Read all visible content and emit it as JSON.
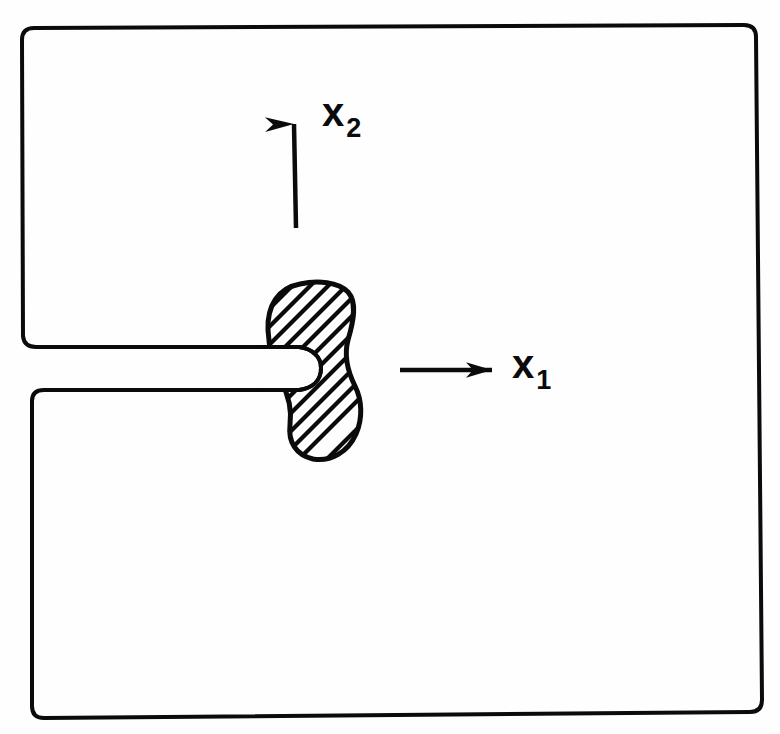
{
  "figure": {
    "background_color": "#fefefe",
    "ink_color": "#0b0b0b"
  },
  "labels": {
    "x1": {
      "base": "x",
      "sub": "1",
      "icon": "axis-label-x1"
    },
    "x2": {
      "base": "x",
      "sub": "2",
      "icon": "axis-label-x2"
    }
  },
  "arrows": {
    "x1": {
      "direction": "right",
      "icon": "arrow-right-icon",
      "start": [
        400,
        370
      ],
      "end": [
        497,
        370
      ]
    },
    "x2": {
      "direction": "up",
      "icon": "arrow-up-icon",
      "start": [
        296,
        228
      ],
      "end": [
        294,
        115
      ]
    }
  },
  "geometry": {
    "plate_outline": {
      "name": "plate-boundary",
      "corners": [
        [
          22,
          28
        ],
        [
          755,
          25
        ],
        [
          762,
          712
        ],
        [
          32,
          718
        ]
      ],
      "stroke_width": 4,
      "note": "rectangular plate boundary, slightly skewed, interrupted on the left edge by the crack mouth"
    },
    "crack": {
      "name": "edge-crack-slot",
      "mouth_upper_y": 347,
      "mouth_lower_y": 390,
      "tip_x": 299,
      "tip_shape": "rounded-blunt",
      "stroke_width": 4
    },
    "plastic_zone": {
      "name": "hatched-plastic-zone",
      "fill": "none",
      "hatch_angle_deg": 45,
      "hatch_spacing_px": 13,
      "stroke_width": 5,
      "bbox": [
        267,
        283,
        98,
        177
      ],
      "shape": "peanut-kidney"
    }
  }
}
